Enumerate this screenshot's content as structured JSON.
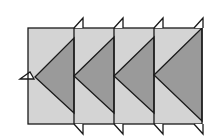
{
  "diagram": {
    "title": "",
    "colors": {
      "background": "#ffffff",
      "panel_fill": "#d4d4d4",
      "triangle_fill": "#9a9a9a",
      "stroke": "#1a1a1a"
    },
    "outer_rect": {
      "x": 28,
      "y": 28,
      "width": 174,
      "height": 96
    },
    "panels": [
      {
        "x0": 28,
        "x1": 74,
        "apex": [
          35,
          77
        ],
        "top": [
          74,
          38
        ],
        "bottom": [
          74,
          113
        ]
      },
      {
        "x0": 74,
        "x1": 114,
        "apex": [
          74,
          76
        ],
        "top": [
          114,
          37
        ],
        "bottom": [
          114,
          113
        ]
      },
      {
        "x0": 114,
        "x1": 154,
        "apex": [
          114,
          76
        ],
        "top": [
          154,
          37
        ],
        "bottom": [
          154,
          113
        ]
      },
      {
        "x0": 154,
        "x1": 202,
        "apex": [
          154,
          75
        ],
        "top": [
          202,
          28
        ],
        "bottom": [
          202,
          121
        ]
      }
    ],
    "top_tabs_x": [
      74,
      114,
      154,
      194
    ],
    "bottom_tabs_x": [
      74,
      114,
      154,
      194
    ],
    "left_tab": {
      "y": 79,
      "x_start": 20,
      "x_end": 34
    }
  }
}
